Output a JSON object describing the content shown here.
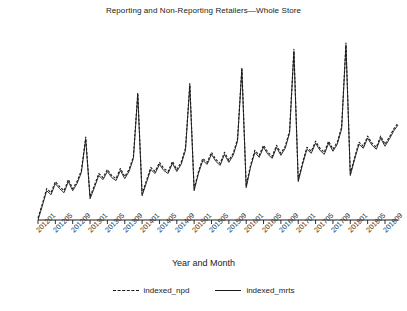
{
  "chart_data": {
    "type": "line",
    "title": "Reporting and Non-Reporting Retailers—Whole Store",
    "xlabel": "Year and Month",
    "ylabel": "",
    "grid": false,
    "legend_position": "bottom",
    "ylim": [
      70,
      260
    ],
    "xlim": [
      "201201",
      "201812"
    ],
    "tick_step_months": 4,
    "tick_labels": [
      "201201",
      "201205",
      "201209",
      "201301",
      "201305",
      "201309",
      "201401",
      "201405",
      "201409",
      "201501",
      "201505",
      "201509",
      "201601",
      "201605",
      "201609",
      "201701",
      "201705",
      "201709",
      "201801",
      "201805",
      "201809"
    ],
    "x": [
      "201201",
      "201202",
      "201203",
      "201204",
      "201205",
      "201206",
      "201207",
      "201208",
      "201209",
      "201210",
      "201211",
      "201212",
      "201301",
      "201302",
      "201303",
      "201304",
      "201305",
      "201306",
      "201307",
      "201308",
      "201309",
      "201310",
      "201311",
      "201312",
      "201401",
      "201402",
      "201403",
      "201404",
      "201405",
      "201406",
      "201407",
      "201408",
      "201409",
      "201410",
      "201411",
      "201412",
      "201501",
      "201502",
      "201503",
      "201504",
      "201505",
      "201506",
      "201507",
      "201508",
      "201509",
      "201510",
      "201511",
      "201512",
      "201601",
      "201602",
      "201603",
      "201604",
      "201605",
      "201606",
      "201607",
      "201608",
      "201609",
      "201610",
      "201611",
      "201612",
      "201701",
      "201702",
      "201703",
      "201704",
      "201705",
      "201706",
      "201707",
      "201708",
      "201709",
      "201710",
      "201711",
      "201712",
      "201801",
      "201802",
      "201803",
      "201804",
      "201805",
      "201806",
      "201807",
      "201808",
      "201809",
      "201810",
      "201811",
      "201812"
    ],
    "series": [
      {
        "name": "indexed_npd",
        "style": "dashed",
        "color": "#1a1a1a",
        "values": [
          72,
          86,
          101,
          97,
          108,
          103,
          99,
          110,
          101,
          108,
          119,
          152,
          93,
          104,
          116,
          112,
          120,
          114,
          111,
          121,
          113,
          120,
          133,
          196,
          96,
          109,
          122,
          118,
          127,
          121,
          118,
          128,
          120,
          127,
          141,
          205,
          101,
          118,
          131,
          127,
          137,
          130,
          126,
          137,
          129,
          136,
          150,
          221,
          104,
          124,
          139,
          134,
          144,
          137,
          133,
          144,
          136,
          143,
          158,
          239,
          110,
          127,
          142,
          138,
          148,
          141,
          137,
          148,
          140,
          147,
          162,
          245,
          116,
          132,
          147,
          143,
          153,
          146,
          142,
          153,
          145,
          152,
          160,
          166
        ]
      },
      {
        "name": "indexed_mrts",
        "style": "solid",
        "color": "#1a1a1a",
        "values": [
          70,
          84,
          99,
          95,
          106,
          101,
          97,
          108,
          99,
          106,
          117,
          150,
          91,
          102,
          114,
          110,
          118,
          112,
          109,
          119,
          111,
          118,
          131,
          194,
          94,
          107,
          120,
          116,
          125,
          119,
          116,
          126,
          118,
          125,
          139,
          203,
          99,
          116,
          129,
          125,
          135,
          128,
          124,
          135,
          127,
          134,
          148,
          219,
          102,
          122,
          137,
          132,
          142,
          135,
          131,
          142,
          134,
          141,
          156,
          237,
          108,
          125,
          140,
          136,
          146,
          139,
          135,
          146,
          138,
          145,
          160,
          243,
          114,
          130,
          145,
          141,
          151,
          144,
          140,
          151,
          143,
          150,
          158,
          164
        ]
      }
    ]
  },
  "legend": {
    "entries": [
      {
        "label": "indexed_npd",
        "style": "dashed"
      },
      {
        "label": "indexed_mrts",
        "style": "solid"
      }
    ]
  }
}
